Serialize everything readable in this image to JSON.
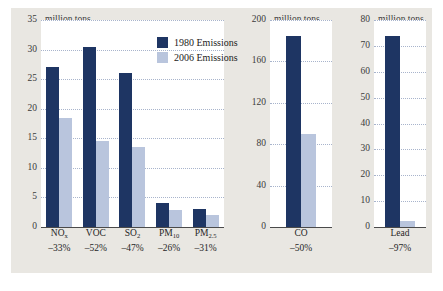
{
  "chart_data": {
    "type": "bar",
    "title": "",
    "xlabel": "",
    "ylabel": "million tons",
    "grid": true,
    "legend_position": "top-center-of-first-panel",
    "colors": {
      "series_1980": "#1e3563",
      "series_2006": "#b9c5dd",
      "panel_background": "#ffffff",
      "figure_background": "#e9e7e2",
      "gridline": "#9aa8c4",
      "axis": "#4a4a4a",
      "text": "#262626"
    },
    "legend": [
      {
        "label": "1980 Emissions",
        "color": "#1e3563"
      },
      {
        "label": "2006 Emissions",
        "color": "#b9c5dd"
      }
    ],
    "series": [
      {
        "name": "1980 Emissions",
        "values": [
          27.0,
          30.5,
          26.0,
          4.0,
          3.1,
          185,
          74
        ]
      },
      {
        "name": "2006 Emissions",
        "values": [
          18.5,
          14.6,
          13.6,
          2.8,
          2.0,
          90,
          2.2
        ]
      }
    ],
    "categories": [
      "NOx",
      "VOC",
      "SO2",
      "PM10",
      "PM2.5",
      "CO",
      "Lead"
    ],
    "percent_change": [
      "-33%",
      "-52%",
      "-47%",
      "-26%",
      "-31%",
      "-50%",
      "-97%"
    ],
    "panels": [
      {
        "id": "panel-left",
        "unit": "million tons",
        "ylim": [
          0,
          35
        ],
        "yticks": [
          35,
          30,
          25,
          20,
          15,
          10,
          5,
          0
        ],
        "ytick_labels": [
          "35",
          "30",
          "25",
          "20",
          "15",
          "10",
          "5",
          "0"
        ],
        "bars": [
          {
            "name_main": "NO",
            "name_sub": "x",
            "change": "–33%",
            "v1980": 27.0,
            "v2006": 18.5
          },
          {
            "name_main": "VOC",
            "name_sub": "",
            "change": "–52%",
            "v1980": 30.5,
            "v2006": 14.6
          },
          {
            "name_main": "SO",
            "name_sub": "2",
            "change": "–47%",
            "v1980": 26.0,
            "v2006": 13.6
          },
          {
            "name_main": "PM",
            "name_sub": "10",
            "change": "–26%",
            "v1980": 4.0,
            "v2006": 2.8
          },
          {
            "name_main": "PM",
            "name_sub": "2.5",
            "change": "–31%",
            "v1980": 3.1,
            "v2006": 2.0
          }
        ]
      },
      {
        "id": "panel-middle",
        "unit": "million tons",
        "ylim": [
          0,
          200
        ],
        "yticks": [
          200,
          160,
          120,
          80,
          40,
          0
        ],
        "ytick_labels": [
          "200",
          "160",
          "120",
          "80",
          "40",
          "0"
        ],
        "bars": [
          {
            "name_main": "CO",
            "name_sub": "",
            "change": "–50%",
            "v1980": 185,
            "v2006": 90
          }
        ]
      },
      {
        "id": "panel-right",
        "unit": "million tons",
        "ylim": [
          0,
          80
        ],
        "yticks": [
          80,
          70,
          60,
          50,
          40,
          30,
          20,
          10,
          0
        ],
        "ytick_labels": [
          "80",
          "70",
          "60",
          "50",
          "40",
          "30",
          "20",
          "10",
          "0"
        ],
        "bars": [
          {
            "name_main": "Lead",
            "name_sub": "",
            "change": "–97%",
            "v1980": 74,
            "v2006": 2.2
          }
        ]
      }
    ]
  }
}
